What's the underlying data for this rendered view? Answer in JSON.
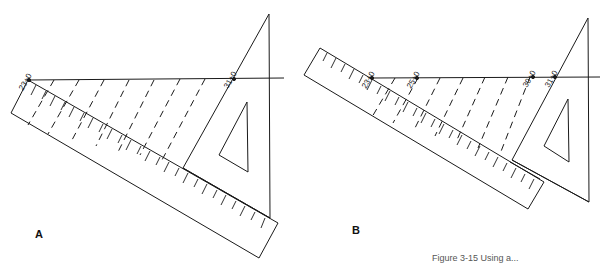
{
  "figure": {
    "caption": "Figure 3-15 Using a...",
    "panels": [
      {
        "id": "A",
        "label": "A",
        "measurement_labels": [
          "23+0",
          "31+0"
        ]
      },
      {
        "id": "B",
        "label": "B",
        "measurement_labels": [
          "23+0",
          "25+0",
          "30+0",
          "31+0"
        ]
      }
    ]
  },
  "colors": {
    "line": "#1a1a1a",
    "background": "#ffffff"
  }
}
